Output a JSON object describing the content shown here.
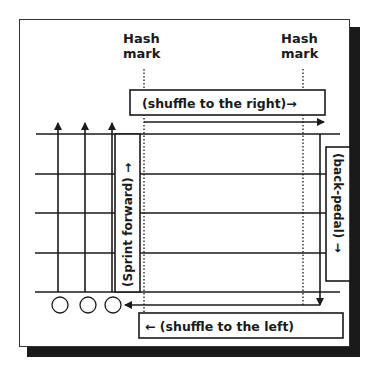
{
  "diagram": {
    "type": "football-field-drill",
    "hash_marks": [
      {
        "label_line1": "Hash",
        "label_line2": "mark",
        "x": 144
      },
      {
        "label_line1": "Hash",
        "label_line2": "mark",
        "x": 303
      }
    ],
    "labels": {
      "shuffle_right": "(shuffle to the right)→",
      "shuffle_left": "← (shuffle to the left)",
      "sprint_forward": "(Sprint forward) →",
      "back_pedal": "(back-pedal) →"
    },
    "yard_lines_count": 5,
    "players_count": 3,
    "colors": {
      "ink": "#1a1a1a",
      "background": "#ffffff",
      "shadow": "#1a1a1a"
    }
  }
}
